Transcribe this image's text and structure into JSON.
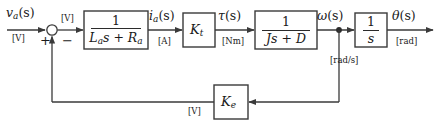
{
  "diagram": {
    "type": "control-block-diagram",
    "stroke_color": "#3a3a3a",
    "text_color": "#1a1a1a",
    "background": "#ffffff"
  },
  "signals": {
    "input": {
      "name_main": "v",
      "name_sub": "a",
      "name_tail": "(s)",
      "unit": "[V]"
    },
    "error": {
      "unit": "[V]"
    },
    "current": {
      "name_main": "i",
      "name_sub": "a",
      "name_tail": "(s)",
      "unit": "[A]"
    },
    "torque": {
      "name_main": "τ",
      "name_sub": "",
      "name_tail": "(s)",
      "unit": "[Nm]"
    },
    "speed": {
      "name_main": "ω",
      "name_sub": "",
      "name_tail": "(s)",
      "unit": "[rad/s]"
    },
    "position": {
      "name_main": "θ",
      "name_sub": "",
      "name_tail": "(s)",
      "unit": "[rad]"
    },
    "feedback": {
      "unit": "[V]"
    }
  },
  "summing_junction": {
    "plus": "+",
    "minus": "−"
  },
  "blocks": {
    "electrical": {
      "numerator": "1",
      "denominator_main": "L",
      "denominator_sub": "a",
      "denominator_tail": "s + R",
      "denominator_sub2": "a"
    },
    "torque_constant": {
      "main": "K",
      "sub": "t"
    },
    "mechanical": {
      "numerator": "1",
      "denominator": "Js + D"
    },
    "integrator": {
      "numerator": "1",
      "denominator": "s"
    },
    "back_emf": {
      "main": "K",
      "sub": "e"
    }
  }
}
